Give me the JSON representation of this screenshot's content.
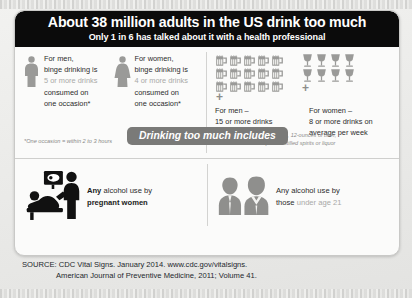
{
  "header": {
    "title": "About 38 million adults in the US drink too much",
    "subtitle": "Only 1 in 6 has talked about it with a health professional"
  },
  "binge": {
    "men": {
      "line1": "For men,",
      "line2": "binge drinking is",
      "highlight": "5 or more drinks",
      "line4": "consumed on",
      "line5": "one occasion*",
      "icon": "male-silhouette-icon"
    },
    "women": {
      "line1": "For women,",
      "line2": "binge drinking is",
      "highlight": "4 or more drinks",
      "line4": "consumed on",
      "line5": "one occasion*",
      "icon": "female-silhouette-icon"
    },
    "footnote": "*One occasion = within 2 to 3 hours"
  },
  "heavy": {
    "men": {
      "label": "For men –",
      "line1": "15 or more drinks",
      "line2": "on average per week",
      "icon_count": 15,
      "icon": "beer-mug-icon",
      "plus": "+"
    },
    "women": {
      "label": "For women –",
      "line1": "8 or more drinks on",
      "line2": "average per week",
      "icon_count": 8,
      "icon": "wine-glass-icon",
      "plus": "+"
    },
    "note_line1": "One Drink = 5-ounces of wine, 12-ounces of beer,",
    "note_line2": "or 1 ½-ounces of 80-proof distilled spirits or liquor"
  },
  "banner": {
    "label": "Drinking too much includes"
  },
  "includes": {
    "pregnant": {
      "strong": "Any",
      "rest": " alcohol use by",
      "line2": "pregnant women",
      "icon": "pregnant-ultrasound-icon"
    },
    "under21": {
      "line1": "Any alcohol use by",
      "line2_plain": "those ",
      "line2_highlight": "under age 21",
      "icon": "two-young-people-icon"
    }
  },
  "source": {
    "line1": "SOURCE: CDC Vital Signs. January 2014. www.cdc.gov/vitalsigns.",
    "line2": "American Journal of Preventive Medicine, 2011; Volume 41."
  },
  "colors": {
    "header_bg": "#0b0b0b",
    "banner_bg": "#7a7a78",
    "icon_gray": "#9a9a98",
    "text_dark": "#2b2b2b",
    "highlight_gray": "#a9a9a7"
  }
}
